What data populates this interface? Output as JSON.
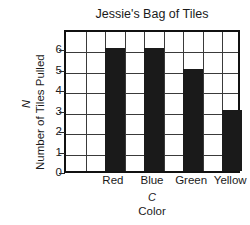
{
  "chart_data": {
    "type": "bar",
    "title": "Jessie's Bag of Tiles",
    "categories": [
      "Red",
      "Blue",
      "Green",
      "Yellow"
    ],
    "values": [
      6,
      6,
      5,
      3
    ],
    "xlabel": "Color",
    "xvar": "C",
    "ylabel": "Number of Tiles Pulled",
    "yvar": "N",
    "ylim": [
      0,
      7
    ],
    "yticks": [
      0,
      1,
      2,
      3,
      4,
      5,
      6
    ],
    "grid": true,
    "legend": false,
    "bar_color": "#1a1a1a",
    "grid_color": "#3a3a3a",
    "border_color": "#111111",
    "grid_columns": 9,
    "bar_columns": [
      3,
      5,
      7,
      9
    ]
  }
}
